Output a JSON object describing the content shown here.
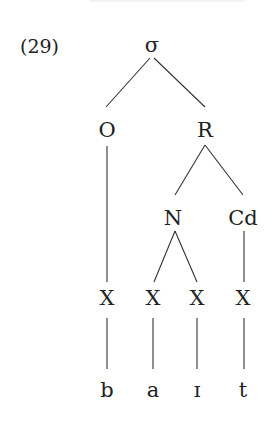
{
  "example": {
    "number": "(29)"
  },
  "tree": {
    "root": {
      "label": "σ",
      "x": 152,
      "y": 52
    },
    "nodes": [
      {
        "id": "onset",
        "label": "O",
        "x": 107,
        "y": 137
      },
      {
        "id": "rhyme",
        "label": "R",
        "x": 205,
        "y": 137
      },
      {
        "id": "nucleus",
        "label": "N",
        "x": 173,
        "y": 225
      },
      {
        "id": "coda",
        "label": "Cd",
        "x": 243,
        "y": 225
      }
    ],
    "timing_slots": [
      {
        "label": "X",
        "x": 107,
        "y": 305
      },
      {
        "label": "X",
        "x": 153,
        "y": 305
      },
      {
        "label": "X",
        "x": 197,
        "y": 305
      },
      {
        "label": "X",
        "x": 243,
        "y": 305
      }
    ],
    "segments": [
      {
        "label": "b",
        "x": 107,
        "y": 397
      },
      {
        "label": "a",
        "x": 153,
        "y": 397
      },
      {
        "label": "ɪ",
        "x": 197,
        "y": 397
      },
      {
        "label": "t",
        "x": 243,
        "y": 397
      }
    ],
    "edges": [
      {
        "from": "σ",
        "to": "O",
        "x1": 150,
        "y1": 58,
        "x2": 106,
        "y2": 107
      },
      {
        "from": "σ",
        "to": "R",
        "x1": 154,
        "y1": 58,
        "x2": 205,
        "y2": 107
      },
      {
        "from": "O",
        "to": "X1",
        "x1": 107,
        "y1": 146,
        "x2": 107,
        "y2": 282
      },
      {
        "from": "R",
        "to": "N",
        "x1": 205,
        "y1": 145,
        "x2": 175,
        "y2": 195
      },
      {
        "from": "R",
        "to": "Cd",
        "x1": 205,
        "y1": 145,
        "x2": 243,
        "y2": 195
      },
      {
        "from": "N",
        "to": "X2",
        "x1": 175,
        "y1": 231,
        "x2": 154,
        "y2": 282
      },
      {
        "from": "N",
        "to": "X3",
        "x1": 175,
        "y1": 231,
        "x2": 197,
        "y2": 282
      },
      {
        "from": "Cd",
        "to": "X4",
        "x1": 244,
        "y1": 231,
        "x2": 244,
        "y2": 282
      },
      {
        "from": "X1",
        "to": "b",
        "x1": 107,
        "y1": 318,
        "x2": 107,
        "y2": 369
      },
      {
        "from": "X2",
        "to": "a",
        "x1": 153,
        "y1": 318,
        "x2": 153,
        "y2": 369
      },
      {
        "from": "X3",
        "to": "ɪ",
        "x1": 197,
        "y1": 318,
        "x2": 197,
        "y2": 369
      },
      {
        "from": "X4",
        "to": "t",
        "x1": 244,
        "y1": 318,
        "x2": 244,
        "y2": 369
      }
    ]
  },
  "colors": {
    "ink": "#222222",
    "line": "#333333",
    "background": "#ffffff"
  }
}
